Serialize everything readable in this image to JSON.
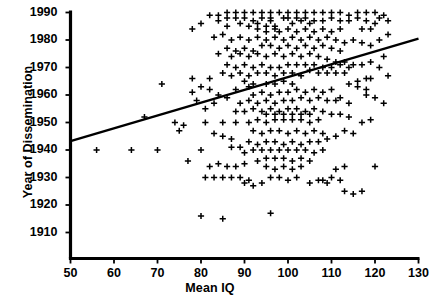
{
  "chart_data": {
    "type": "scatter",
    "title": "",
    "xlabel": "Mean IQ",
    "ylabel": "Year of Dissemination",
    "xlim": [
      50,
      130
    ],
    "ylim": [
      1905,
      1992
    ],
    "xticks": [
      50,
      60,
      70,
      80,
      90,
      100,
      110,
      120,
      130
    ],
    "yticks": [
      1910,
      1920,
      1930,
      1940,
      1950,
      1960,
      1970,
      1980,
      1990
    ],
    "grid": false,
    "legend": null,
    "marker": "plus",
    "marker_color": "#000000",
    "line_color": "#000000",
    "trendline": {
      "name": "linear fit",
      "x": [
        50,
        130
      ],
      "y": [
        1943.2,
        1980.5
      ]
    },
    "points": [
      [
        56,
        1940
      ],
      [
        64,
        1940
      ],
      [
        70,
        1940
      ],
      [
        77,
        1936
      ],
      [
        80,
        1940
      ],
      [
        67,
        1952
      ],
      [
        74,
        1950
      ],
      [
        81,
        1950
      ],
      [
        85,
        1950
      ],
      [
        88,
        1950
      ],
      [
        71,
        1964
      ],
      [
        78,
        1966
      ],
      [
        82,
        1966
      ],
      [
        90,
        1965
      ],
      [
        91,
        1963
      ],
      [
        92,
        1964
      ],
      [
        95,
        1964
      ],
      [
        97,
        1964
      ],
      [
        99,
        1965
      ],
      [
        101,
        1964
      ],
      [
        86,
        1985
      ],
      [
        93,
        1986
      ],
      [
        96,
        1987
      ],
      [
        97,
        1985
      ],
      [
        95,
        1983
      ],
      [
        101,
        1986
      ],
      [
        103,
        1987
      ],
      [
        105,
        1986
      ],
      [
        99,
        1988
      ],
      [
        100,
        1988
      ],
      [
        102,
        1988
      ],
      [
        104,
        1988
      ],
      [
        106,
        1987
      ],
      [
        108,
        1987
      ],
      [
        110,
        1988
      ],
      [
        112,
        1987
      ],
      [
        114,
        1987
      ],
      [
        116,
        1988
      ],
      [
        118,
        1987
      ],
      [
        120,
        1986
      ],
      [
        88,
        1988
      ],
      [
        90,
        1988
      ],
      [
        92,
        1987
      ],
      [
        94,
        1988
      ],
      [
        96,
        1988
      ],
      [
        84,
        1987
      ],
      [
        86,
        1988
      ],
      [
        89,
        1986
      ],
      [
        91,
        1985
      ],
      [
        93,
        1984
      ],
      [
        95,
        1985
      ],
      [
        97,
        1984
      ],
      [
        98,
        1983
      ],
      [
        100,
        1984
      ],
      [
        102,
        1983
      ],
      [
        104,
        1984
      ],
      [
        106,
        1983
      ],
      [
        108,
        1984
      ],
      [
        110,
        1983
      ],
      [
        112,
        1984
      ],
      [
        83,
        1981
      ],
      [
        85,
        1982
      ],
      [
        87,
        1980
      ],
      [
        89,
        1981
      ],
      [
        91,
        1980
      ],
      [
        93,
        1981
      ],
      [
        95,
        1980
      ],
      [
        97,
        1981
      ],
      [
        99,
        1980
      ],
      [
        101,
        1981
      ],
      [
        103,
        1980
      ],
      [
        105,
        1981
      ],
      [
        107,
        1980
      ],
      [
        109,
        1981
      ],
      [
        111,
        1980
      ],
      [
        113,
        1979
      ],
      [
        115,
        1980
      ],
      [
        117,
        1979
      ],
      [
        94,
        1978
      ],
      [
        96,
        1978
      ],
      [
        98,
        1977
      ],
      [
        100,
        1978
      ],
      [
        102,
        1977
      ],
      [
        104,
        1978
      ],
      [
        106,
        1977
      ],
      [
        108,
        1978
      ],
      [
        110,
        1977
      ],
      [
        112,
        1976
      ],
      [
        86,
        1977
      ],
      [
        88,
        1976
      ],
      [
        90,
        1977
      ],
      [
        92,
        1976
      ],
      [
        84,
        1975
      ],
      [
        87,
        1974
      ],
      [
        89,
        1975
      ],
      [
        91,
        1974
      ],
      [
        93,
        1975
      ],
      [
        95,
        1974
      ],
      [
        97,
        1975
      ],
      [
        99,
        1974
      ],
      [
        101,
        1975
      ],
      [
        103,
        1974
      ],
      [
        105,
        1975
      ],
      [
        107,
        1974
      ],
      [
        109,
        1973
      ],
      [
        111,
        1972
      ],
      [
        113,
        1972
      ],
      [
        115,
        1971
      ],
      [
        117,
        1971
      ],
      [
        119,
        1972
      ],
      [
        100,
        1971
      ],
      [
        102,
        1971
      ],
      [
        104,
        1971
      ],
      [
        106,
        1971
      ],
      [
        108,
        1970
      ],
      [
        110,
        1970
      ],
      [
        112,
        1971
      ],
      [
        114,
        1970
      ],
      [
        96,
        1970
      ],
      [
        98,
        1970
      ],
      [
        94,
        1971
      ],
      [
        92,
        1970
      ],
      [
        90,
        1971
      ],
      [
        88,
        1970
      ],
      [
        86,
        1971
      ],
      [
        105,
        1969
      ],
      [
        107,
        1968
      ],
      [
        109,
        1968
      ],
      [
        111,
        1968
      ],
      [
        113,
        1968
      ],
      [
        99,
        1968
      ],
      [
        101,
        1968
      ],
      [
        103,
        1967
      ],
      [
        97,
        1967
      ],
      [
        95,
        1968
      ],
      [
        93,
        1968
      ],
      [
        91,
        1967
      ],
      [
        89,
        1968
      ],
      [
        87,
        1967
      ],
      [
        85,
        1968
      ],
      [
        122,
        1974
      ],
      [
        123,
        1967
      ],
      [
        121,
        1970
      ],
      [
        119,
        1966
      ],
      [
        100,
        1961
      ],
      [
        102,
        1962
      ],
      [
        104,
        1961
      ],
      [
        106,
        1962
      ],
      [
        108,
        1961
      ],
      [
        110,
        1962
      ],
      [
        98,
        1961
      ],
      [
        96,
        1960
      ],
      [
        94,
        1961
      ],
      [
        92,
        1960
      ],
      [
        103,
        1959
      ],
      [
        105,
        1958
      ],
      [
        107,
        1959
      ],
      [
        109,
        1958
      ],
      [
        111,
        1958
      ],
      [
        99,
        1958
      ],
      [
        101,
        1958
      ],
      [
        97,
        1957
      ],
      [
        95,
        1958
      ],
      [
        93,
        1957
      ],
      [
        91,
        1958
      ],
      [
        89,
        1957
      ],
      [
        112,
        1959
      ],
      [
        114,
        1957
      ],
      [
        100,
        1955
      ],
      [
        102,
        1955
      ],
      [
        104,
        1954
      ],
      [
        106,
        1955
      ],
      [
        98,
        1954
      ],
      [
        96,
        1955
      ],
      [
        94,
        1954
      ],
      [
        92,
        1955
      ],
      [
        90,
        1954
      ],
      [
        88,
        1954
      ],
      [
        108,
        1954
      ],
      [
        110,
        1953
      ],
      [
        112,
        1953
      ],
      [
        114,
        1952
      ],
      [
        99,
        1951
      ],
      [
        101,
        1951
      ],
      [
        103,
        1951
      ],
      [
        97,
        1951
      ],
      [
        95,
        1950
      ],
      [
        93,
        1951
      ],
      [
        91,
        1950
      ],
      [
        105,
        1950
      ],
      [
        107,
        1951
      ],
      [
        96,
        1947
      ],
      [
        98,
        1947
      ],
      [
        100,
        1946
      ],
      [
        102,
        1947
      ],
      [
        94,
        1946
      ],
      [
        92,
        1947
      ],
      [
        104,
        1946
      ],
      [
        106,
        1947
      ],
      [
        108,
        1946
      ],
      [
        95,
        1943
      ],
      [
        97,
        1943
      ],
      [
        99,
        1942
      ],
      [
        101,
        1943
      ],
      [
        93,
        1942
      ],
      [
        91,
        1943
      ],
      [
        103,
        1942
      ],
      [
        105,
        1943
      ],
      [
        96,
        1940
      ],
      [
        98,
        1940
      ],
      [
        100,
        1940
      ],
      [
        102,
        1940
      ],
      [
        94,
        1940
      ],
      [
        92,
        1940
      ],
      [
        90,
        1939
      ],
      [
        104,
        1940
      ],
      [
        106,
        1939
      ],
      [
        108,
        1940
      ],
      [
        95,
        1937
      ],
      [
        97,
        1937
      ],
      [
        99,
        1937
      ],
      [
        101,
        1936
      ],
      [
        93,
        1936
      ],
      [
        103,
        1937
      ],
      [
        105,
        1936
      ],
      [
        82,
        1934
      ],
      [
        84,
        1935
      ],
      [
        86,
        1934
      ],
      [
        88,
        1934
      ],
      [
        90,
        1935
      ],
      [
        95,
        1934
      ],
      [
        97,
        1933
      ],
      [
        99,
        1934
      ],
      [
        101,
        1933
      ],
      [
        103,
        1934
      ],
      [
        111,
        1933
      ],
      [
        113,
        1934
      ],
      [
        120,
        1934
      ],
      [
        81,
        1930
      ],
      [
        83,
        1930
      ],
      [
        85,
        1930
      ],
      [
        87,
        1930
      ],
      [
        89,
        1930
      ],
      [
        91,
        1929
      ],
      [
        96,
        1930
      ],
      [
        98,
        1930
      ],
      [
        100,
        1929
      ],
      [
        102,
        1930
      ],
      [
        108,
        1929
      ],
      [
        110,
        1930
      ],
      [
        112,
        1929
      ],
      [
        80,
        1916
      ],
      [
        96,
        1917
      ],
      [
        85,
        1915
      ],
      [
        113,
        1925
      ],
      [
        115,
        1924
      ],
      [
        117,
        1925
      ],
      [
        118,
        1960
      ],
      [
        120,
        1959
      ],
      [
        122,
        1957
      ],
      [
        116,
        1963
      ],
      [
        118,
        1962
      ],
      [
        114,
        1964
      ],
      [
        116,
        1965
      ],
      [
        118,
        1966
      ],
      [
        83,
        1957
      ],
      [
        81,
        1955
      ],
      [
        79,
        1958
      ],
      [
        84,
        1960
      ],
      [
        86,
        1959
      ],
      [
        88,
        1962
      ],
      [
        82,
        1962
      ],
      [
        80,
        1963
      ],
      [
        78,
        1961
      ],
      [
        76,
        1949
      ],
      [
        75,
        1947
      ],
      [
        107,
        1943
      ],
      [
        109,
        1944
      ],
      [
        111,
        1945
      ],
      [
        113,
        1947
      ],
      [
        115,
        1946
      ],
      [
        117,
        1950
      ],
      [
        119,
        1951
      ],
      [
        87,
        1944
      ],
      [
        85,
        1945
      ],
      [
        83,
        1946
      ],
      [
        89,
        1941
      ],
      [
        87,
        1941
      ],
      [
        105,
        1928
      ],
      [
        107,
        1929
      ],
      [
        109,
        1928
      ],
      [
        92,
        1927
      ],
      [
        94,
        1928
      ],
      [
        90,
        1928
      ],
      [
        119,
        1978
      ],
      [
        121,
        1980
      ],
      [
        123,
        1982
      ],
      [
        117,
        1984
      ],
      [
        119,
        1984
      ],
      [
        121,
        1988
      ],
      [
        123,
        1987
      ],
      [
        78,
        1984
      ],
      [
        80,
        1986
      ],
      [
        82,
        1989
      ],
      [
        84,
        1989
      ],
      [
        86,
        1990
      ],
      [
        88,
        1990
      ],
      [
        90,
        1990
      ],
      [
        92,
        1990
      ],
      [
        94,
        1990
      ],
      [
        96,
        1990
      ],
      [
        98,
        1990
      ],
      [
        100,
        1990
      ],
      [
        102,
        1990
      ],
      [
        104,
        1990
      ],
      [
        106,
        1990
      ],
      [
        108,
        1990
      ],
      [
        110,
        1990
      ],
      [
        112,
        1990
      ],
      [
        114,
        1989
      ],
      [
        116,
        1990
      ],
      [
        118,
        1990
      ],
      [
        120,
        1990
      ],
      [
        122,
        1989
      ],
      [
        99,
        1953
      ],
      [
        101,
        1953
      ],
      [
        97,
        1953
      ],
      [
        95,
        1953
      ],
      [
        103,
        1953
      ],
      [
        105,
        1953
      ]
    ]
  },
  "caption_strip": "",
  "axes": {
    "x_axis_name": "x-axis",
    "y_axis_name": "y-axis"
  }
}
